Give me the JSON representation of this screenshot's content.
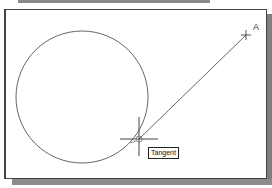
{
  "window": {
    "type": "cad-drawing-area"
  },
  "drawing": {
    "circle": {
      "cx": 82,
      "cy": 97,
      "r": 66
    },
    "line": {
      "from": [
        139,
        139
      ],
      "to": [
        246,
        35
      ]
    },
    "point_label": "A",
    "cursor": {
      "x": 139,
      "y": 139
    }
  },
  "snap_tooltip": {
    "label": "Tangent"
  },
  "colors": {
    "stroke": "#555555",
    "frame": "#444444",
    "shadow": "#808080"
  }
}
